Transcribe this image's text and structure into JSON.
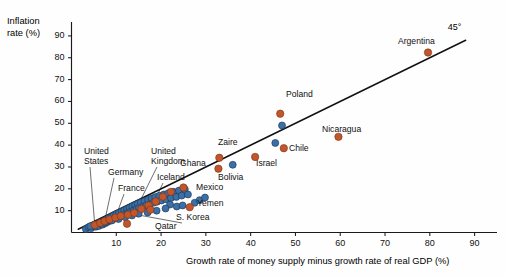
{
  "chart_data": {
    "type": "scatter",
    "title": "",
    "xlabel": "Growth rate of money supply minus growth rate of real GDP (%)",
    "ylabel_line1": "Inflation",
    "ylabel_line2": "rate (%)",
    "xlim": [
      0,
      95
    ],
    "ylim": [
      0,
      95
    ],
    "xticks": [
      10,
      20,
      30,
      40,
      50,
      60,
      70,
      80,
      90
    ],
    "yticks": [
      10,
      20,
      30,
      40,
      50,
      60,
      70,
      80,
      90
    ],
    "grid": false,
    "legend": "none",
    "reference_line": {
      "label": "45°",
      "slope": 1,
      "intercept": 0,
      "x_start": 1.5,
      "x_end": 88
    },
    "colors": {
      "series_primary": "#3C6FA6",
      "series_highlight": "#C2562B",
      "marker_edge": "#16324f",
      "marker_edge_highlight": "#7a3318",
      "axis": "#1a1a1a",
      "reference_line": "#111111",
      "leader_line": "#555555",
      "background": "#fefefe"
    },
    "series": [
      {
        "name": "Countries (unlabeled)",
        "color": "#3C6FA6",
        "points": [
          [
            3.2,
            1.6
          ],
          [
            3.8,
            2.4
          ],
          [
            4.4,
            2.0
          ],
          [
            4.9,
            3.2
          ],
          [
            5.4,
            2.6
          ],
          [
            5.8,
            4.0
          ],
          [
            6.1,
            3.0
          ],
          [
            6.5,
            4.6
          ],
          [
            6.9,
            3.6
          ],
          [
            7.2,
            5.2
          ],
          [
            7.5,
            4.2
          ],
          [
            7.8,
            6.0
          ],
          [
            8.0,
            4.8
          ],
          [
            8.3,
            6.6
          ],
          [
            8.6,
            5.4
          ],
          [
            8.9,
            7.2
          ],
          [
            9.1,
            5.9
          ],
          [
            9.4,
            7.8
          ],
          [
            9.7,
            6.4
          ],
          [
            10.0,
            8.4
          ],
          [
            10.3,
            6.9
          ],
          [
            10.6,
            9.0
          ],
          [
            10.9,
            7.4
          ],
          [
            11.2,
            9.6
          ],
          [
            11.5,
            8.0
          ],
          [
            11.8,
            10.2
          ],
          [
            12.1,
            8.5
          ],
          [
            12.4,
            10.8
          ],
          [
            12.7,
            9.1
          ],
          [
            13.0,
            11.4
          ],
          [
            13.3,
            9.6
          ],
          [
            13.6,
            12.0
          ],
          [
            13.9,
            10.2
          ],
          [
            14.2,
            12.6
          ],
          [
            14.5,
            10.8
          ],
          [
            14.8,
            13.2
          ],
          [
            15.1,
            11.3
          ],
          [
            15.5,
            13.8
          ],
          [
            15.9,
            11.9
          ],
          [
            16.3,
            14.4
          ],
          [
            16.7,
            12.5
          ],
          [
            17.1,
            15.0
          ],
          [
            17.5,
            13.0
          ],
          [
            17.9,
            15.6
          ],
          [
            18.3,
            13.6
          ],
          [
            18.7,
            16.2
          ],
          [
            19.1,
            14.1
          ],
          [
            19.6,
            16.8
          ],
          [
            20.1,
            14.7
          ],
          [
            20.6,
            17.4
          ],
          [
            21.1,
            15.2
          ],
          [
            21.6,
            18.0
          ],
          [
            22.2,
            15.8
          ],
          [
            22.8,
            18.6
          ],
          [
            23.4,
            16.3
          ],
          [
            24.0,
            19.2
          ],
          [
            24.6,
            16.9
          ],
          [
            25.3,
            19.8
          ],
          [
            26.0,
            17.4
          ],
          [
            27.5,
            13.6
          ],
          [
            28.6,
            14.8
          ],
          [
            29.8,
            16.0
          ],
          [
            22.0,
            12.8
          ],
          [
            23.5,
            11.9
          ],
          [
            24.8,
            12.4
          ],
          [
            21.0,
            11.0
          ],
          [
            19.0,
            10.0
          ],
          [
            17.0,
            9.2
          ],
          [
            15.0,
            8.6
          ],
          [
            13.5,
            7.8
          ],
          [
            12.0,
            7.0
          ],
          [
            10.5,
            6.2
          ],
          [
            9.0,
            5.5
          ],
          [
            7.6,
            4.9
          ],
          [
            6.3,
            4.2
          ],
          [
            5.1,
            3.5
          ],
          [
            4.2,
            2.9
          ],
          [
            36.0,
            31.0
          ],
          [
            47.0,
            49.0
          ],
          [
            45.5,
            41.0
          ]
        ]
      },
      {
        "name": "Countries (labeled / highlighted)",
        "color": "#C2562B",
        "points": [
          [
            5.2,
            3.4
          ],
          [
            6.4,
            4.4
          ],
          [
            7.4,
            5.2
          ],
          [
            8.5,
            6.0
          ],
          [
            9.8,
            6.8
          ],
          [
            11.0,
            7.6
          ],
          [
            12.6,
            8.2
          ],
          [
            14.0,
            9.0
          ],
          [
            15.6,
            10.8
          ],
          [
            17.2,
            12.4
          ],
          [
            18.8,
            14.2
          ],
          [
            20.4,
            16.4
          ],
          [
            22.2,
            18.6
          ],
          [
            12.4,
            4.0
          ],
          [
            17.6,
            10.4
          ],
          [
            25.0,
            20.6
          ],
          [
            26.4,
            11.6
          ],
          [
            32.8,
            29.2
          ],
          [
            33.0,
            34.2
          ],
          [
            41.0,
            34.6
          ],
          [
            46.6,
            54.4
          ],
          [
            47.4,
            38.6
          ],
          [
            59.6,
            43.8
          ],
          [
            79.6,
            82.4
          ]
        ]
      }
    ],
    "annotations": [
      {
        "text": "United\nStates",
        "label_x": 84,
        "label_y": 146,
        "point": [
          5.2,
          3.4
        ],
        "leader": true
      },
      {
        "text": "Germany",
        "label_x": 108,
        "label_y": 167,
        "point": [
          7.4,
          5.2
        ],
        "leader": true
      },
      {
        "text": "France",
        "label_x": 118,
        "label_y": 183,
        "point": [
          9.8,
          6.8
        ],
        "leader": true
      },
      {
        "text": "United\nKingdom",
        "label_x": 151,
        "label_y": 146,
        "point": [
          14.0,
          9.0
        ],
        "leader": true
      },
      {
        "text": "Iceland",
        "label_x": 157,
        "label_y": 172,
        "point": [
          17.6,
          10.4
        ],
        "leader": true
      },
      {
        "text": "Qatar",
        "label_x": 155,
        "label_y": 221,
        "point": [
          12.4,
          4.0
        ],
        "leader": false
      },
      {
        "text": "S. Korea",
        "label_x": 176,
        "label_y": 212,
        "point": [
          15.0,
          8.0
        ],
        "leader": true
      },
      {
        "text": "Yemen",
        "label_x": 197,
        "label_y": 198,
        "point": [
          26.4,
          11.6
        ],
        "leader": false
      },
      {
        "text": "Mexico",
        "label_x": 196,
        "label_y": 182,
        "point": [
          25.0,
          20.6
        ],
        "leader": false
      },
      {
        "text": "Ghana",
        "label_x": 180,
        "label_y": 158,
        "point": [
          22.2,
          18.6
        ],
        "leader": false
      },
      {
        "text": "Bolivia",
        "label_x": 218,
        "label_y": 172,
        "point": [
          33.0,
          34.2
        ],
        "leader": false
      },
      {
        "text": "Zaire",
        "label_x": 218,
        "label_y": 137,
        "point": [
          32.8,
          29.2
        ],
        "leader": false
      },
      {
        "text": "Israel",
        "label_x": 256,
        "label_y": 158,
        "point": [
          41.0,
          34.6
        ],
        "leader": false
      },
      {
        "text": "Chile",
        "label_x": 289,
        "label_y": 143,
        "point": [
          47.4,
          38.6
        ],
        "leader": false
      },
      {
        "text": "Poland",
        "label_x": 286,
        "label_y": 89,
        "point": [
          46.6,
          54.4
        ],
        "leader": false
      },
      {
        "text": "Nicaragua",
        "label_x": 322,
        "label_y": 124,
        "point": [
          59.6,
          43.8
        ],
        "leader": false
      },
      {
        "text": "Argentina",
        "label_x": 398,
        "label_y": 36,
        "point": [
          79.6,
          82.4
        ],
        "leader": false
      }
    ]
  }
}
